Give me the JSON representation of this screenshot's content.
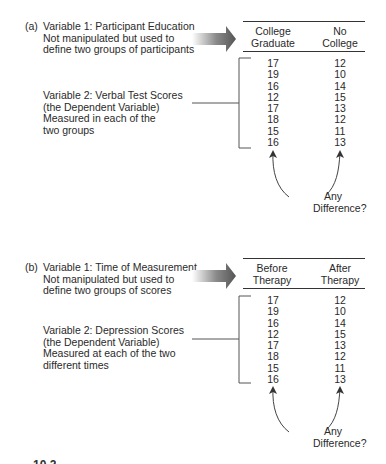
{
  "panels": [
    {
      "label": "(a)",
      "var1": {
        "lines": [
          "Variable 1: Participant Education",
          "Not manipulated but used to",
          "define two groups of participants"
        ]
      },
      "var2": {
        "lines": [
          "Variable 2: Verbal Test Scores",
          "(the Dependent Variable)",
          "Measured in each of the",
          "two groups"
        ]
      },
      "columns": [
        {
          "header": [
            "College",
            "Graduate"
          ],
          "values": [
            "17",
            "19",
            "16",
            "12",
            "17",
            "18",
            "15",
            "16"
          ]
        },
        {
          "header": [
            "No",
            "College"
          ],
          "values": [
            "12",
            "10",
            "14",
            "15",
            "13",
            "12",
            "11",
            "13"
          ]
        }
      ],
      "question": [
        "Any",
        "Difference?"
      ]
    },
    {
      "label": "(b)",
      "var1": {
        "lines": [
          "Variable 1: Time of Measurement",
          "Not manipulated but used to",
          "define two groups of scores"
        ]
      },
      "var2": {
        "lines": [
          "Variable 2: Depression Scores",
          "(the Dependent Variable)",
          "Measured at each of the two",
          "different times"
        ]
      },
      "columns": [
        {
          "header": [
            "Before",
            "Therapy"
          ],
          "values": [
            "17",
            "19",
            "16",
            "12",
            "17",
            "18",
            "15",
            "16"
          ]
        },
        {
          "header": [
            "After",
            "Therapy"
          ],
          "values": [
            "12",
            "10",
            "14",
            "15",
            "13",
            "12",
            "11",
            "13"
          ]
        }
      ],
      "question": [
        "Any",
        "Difference?"
      ]
    }
  ],
  "caption_fragment": "10.2"
}
